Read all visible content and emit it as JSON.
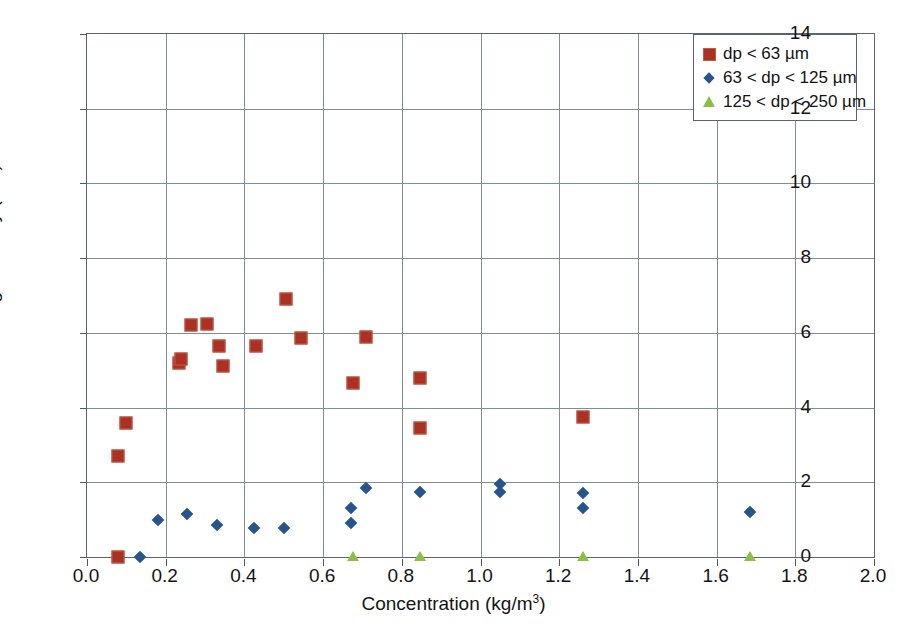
{
  "chart_data": {
    "type": "scatter",
    "title": "",
    "xlabel": "Concentration (kg/m3)",
    "xlabel_base": "Concentration (kg/m",
    "xlabel_sup": "3",
    "xlabel_tail": ")",
    "ylabel": "Average velocity (m/s)",
    "xlim": [
      0.0,
      2.0
    ],
    "ylim": [
      0,
      14
    ],
    "xticks": [
      "0.0",
      "0.2",
      "0.4",
      "0.6",
      "0.8",
      "1.0",
      "1.2",
      "1.4",
      "1.6",
      "1.8",
      "2.0"
    ],
    "xtick_values": [
      0.0,
      0.2,
      0.4,
      0.6,
      0.8,
      1.0,
      1.2,
      1.4,
      1.6,
      1.8,
      2.0
    ],
    "yticks": [
      "0",
      "2",
      "4",
      "6",
      "8",
      "10",
      "12",
      "14"
    ],
    "ytick_values": [
      0,
      2,
      4,
      6,
      8,
      10,
      12,
      14
    ],
    "grid": true,
    "legend_position": "top-right",
    "series": [
      {
        "name": "dp < 63 µm",
        "marker": "square",
        "color": "#aa3224",
        "points": [
          [
            0.08,
            0.0
          ],
          [
            0.08,
            2.7
          ],
          [
            0.1,
            3.6
          ],
          [
            0.235,
            5.2
          ],
          [
            0.24,
            5.3
          ],
          [
            0.265,
            6.2
          ],
          [
            0.305,
            6.25
          ],
          [
            0.335,
            5.65
          ],
          [
            0.345,
            5.1
          ],
          [
            0.43,
            5.65
          ],
          [
            0.505,
            6.9
          ],
          [
            0.545,
            5.85
          ],
          [
            0.675,
            4.65
          ],
          [
            0.71,
            5.9
          ],
          [
            0.845,
            4.8
          ],
          [
            0.845,
            3.45
          ],
          [
            1.26,
            3.75
          ]
        ]
      },
      {
        "name": "63 < dp < 125 µm",
        "marker": "diamond",
        "color": "#27548c",
        "points": [
          [
            0.135,
            0.0
          ],
          [
            0.18,
            0.98
          ],
          [
            0.255,
            1.15
          ],
          [
            0.33,
            0.85
          ],
          [
            0.425,
            0.78
          ],
          [
            0.5,
            0.78
          ],
          [
            0.67,
            1.3
          ],
          [
            0.67,
            0.9
          ],
          [
            0.71,
            1.85
          ],
          [
            0.845,
            1.75
          ],
          [
            1.05,
            1.95
          ],
          [
            1.05,
            1.75
          ],
          [
            1.26,
            1.7
          ],
          [
            1.26,
            1.3
          ],
          [
            1.685,
            1.2
          ]
        ]
      },
      {
        "name": "125 < dp < 250 µm",
        "marker": "triangle",
        "color": "#8cbf43",
        "points": [
          [
            0.675,
            0.0
          ],
          [
            0.845,
            0.0
          ],
          [
            1.26,
            0.0
          ],
          [
            1.685,
            0.0
          ]
        ]
      }
    ]
  }
}
